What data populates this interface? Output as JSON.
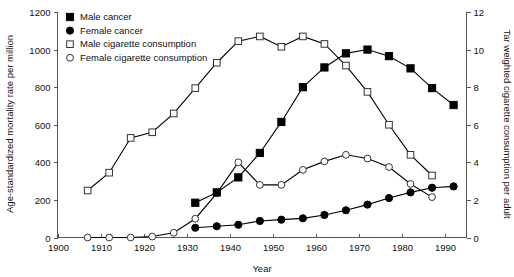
{
  "chart_data": {
    "type": "line",
    "title": "",
    "xlabel": "Year",
    "ylabel": "Age-standardized mortality rate per million",
    "ylabel_right": "Tar weighted cigarette consumption per adult",
    "xlim": [
      1900,
      1995
    ],
    "ylim": [
      0,
      1200
    ],
    "ylim_right": [
      0,
      12
    ],
    "xticks": [
      1900,
      1910,
      1920,
      1930,
      1940,
      1950,
      1960,
      1970,
      1980,
      1990
    ],
    "yticks": [
      0,
      200,
      400,
      600,
      800,
      1000,
      1200
    ],
    "yticks_right": [
      0,
      2,
      4,
      6,
      8,
      10,
      12
    ],
    "grid": false,
    "legend_position": "top-left",
    "series": [
      {
        "name": "Male cancer",
        "marker": "filled-square",
        "axis": "left",
        "x": [
          1932,
          1937,
          1942,
          1947,
          1952,
          1957,
          1962,
          1967,
          1972,
          1977,
          1982,
          1987,
          1992
        ],
        "y": [
          185,
          240,
          320,
          450,
          615,
          800,
          905,
          980,
          1000,
          965,
          900,
          795,
          705
        ]
      },
      {
        "name": "Female cancer",
        "marker": "filled-circle",
        "axis": "left",
        "x": [
          1932,
          1937,
          1942,
          1947,
          1952,
          1957,
          1962,
          1967,
          1972,
          1977,
          1982,
          1987,
          1992
        ],
        "y": [
          52,
          60,
          68,
          88,
          95,
          102,
          120,
          145,
          175,
          210,
          240,
          265,
          272
        ]
      },
      {
        "name": "Male cigarette consumption",
        "marker": "open-square",
        "axis": "right",
        "x": [
          1907,
          1912,
          1917,
          1922,
          1927,
          1932,
          1937,
          1942,
          1947,
          1952,
          1957,
          1962,
          1967,
          1972,
          1977,
          1982,
          1987
        ],
        "y": [
          2.5,
          3.45,
          5.3,
          5.6,
          6.6,
          7.95,
          9.3,
          10.45,
          10.7,
          10.15,
          10.7,
          10.3,
          9.15,
          7.75,
          6.0,
          4.4,
          3.3
        ]
      },
      {
        "name": "Female cigarette consumption",
        "marker": "open-circle",
        "axis": "right",
        "x": [
          1907,
          1912,
          1917,
          1922,
          1927,
          1932,
          1937,
          1942,
          1947,
          1952,
          1957,
          1962,
          1967,
          1972,
          1977,
          1982,
          1987
        ],
        "y": [
          0.0,
          0.0,
          0.0,
          0.05,
          0.25,
          1.0,
          2.35,
          4.0,
          2.8,
          2.8,
          3.6,
          4.05,
          4.4,
          4.2,
          3.75,
          2.85,
          2.15
        ]
      }
    ]
  },
  "axes": {
    "x_title": "Year",
    "y_left_title": "Age-standardized mortality rate per million",
    "y_right_title": "Tar weighted cigarette consumption per adult",
    "x_tick_labels": [
      "1900",
      "1910",
      "1920",
      "1930",
      "1940",
      "1950",
      "1960",
      "1970",
      "1980",
      "1990"
    ],
    "y_left_tick_labels": [
      "0",
      "200",
      "400",
      "600",
      "800",
      "1000",
      "1200"
    ],
    "y_right_tick_labels": [
      "0",
      "2",
      "4",
      "6",
      "8",
      "10",
      "12"
    ]
  },
  "legend": {
    "items": [
      {
        "label": "Male cancer",
        "marker": "filled-square-marker"
      },
      {
        "label": "Female cancer",
        "marker": "filled-circle-marker"
      },
      {
        "label": "Male cigarette consumption",
        "marker": "open-square-marker"
      },
      {
        "label": "Female cigarette consumption",
        "marker": "open-circle-marker"
      }
    ]
  },
  "colors": {
    "line": "#000000",
    "axis": "#555555",
    "background": "#ffffff"
  }
}
